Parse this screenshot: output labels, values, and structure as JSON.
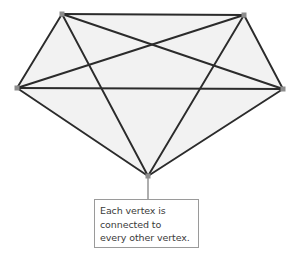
{
  "diagram": {
    "type": "complete-graph",
    "name": "K5 complete graph",
    "vertex_count": 5,
    "edge_count": 10,
    "vertices": [
      {
        "id": "top-left",
        "x": 62,
        "y": 14
      },
      {
        "id": "top-right",
        "x": 244,
        "y": 15
      },
      {
        "id": "left",
        "x": 17,
        "y": 88
      },
      {
        "id": "right",
        "x": 283,
        "y": 89
      },
      {
        "id": "bottom",
        "x": 148,
        "y": 176
      }
    ],
    "edges": [
      {
        "from": "top-left",
        "to": "top-right"
      },
      {
        "from": "top-left",
        "to": "left"
      },
      {
        "from": "top-left",
        "to": "right"
      },
      {
        "from": "top-left",
        "to": "bottom"
      },
      {
        "from": "top-right",
        "to": "left"
      },
      {
        "from": "top-right",
        "to": "right"
      },
      {
        "from": "top-right",
        "to": "bottom"
      },
      {
        "from": "left",
        "to": "right"
      },
      {
        "from": "left",
        "to": "bottom"
      },
      {
        "from": "right",
        "to": "bottom"
      }
    ],
    "colors": {
      "edge": "#2b2b2b",
      "fill": "#f2f2f2",
      "vertex": "#8d8d8d",
      "leader_line": "#9a9a9a",
      "callout_border": "#9a9a9a",
      "callout_background": "#ffffff",
      "text": "#3a3a3a",
      "page_background": "#ffffff"
    }
  },
  "callout": {
    "anchor_vertex": "bottom",
    "leader": {
      "x": 148,
      "y_start": 176,
      "y_end": 199
    },
    "box": {
      "x": 94,
      "y": 199,
      "width": 105,
      "height": 49
    },
    "lines": [
      "Each vertex is",
      "connected to",
      "every other vertex."
    ],
    "full_text": "Each vertex is connected to every other vertex."
  }
}
